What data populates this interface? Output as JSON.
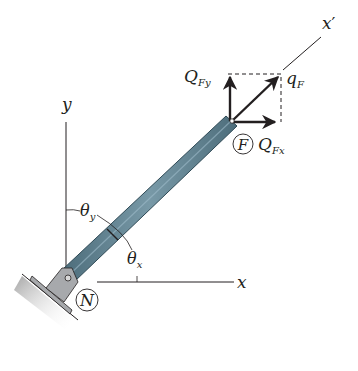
{
  "figure": {
    "axes": {
      "x_label": "x",
      "y_label": "y",
      "x_prime_label": "x",
      "x_prime_mark": "′"
    },
    "nodes": {
      "start": "N",
      "end": "F"
    },
    "angles": {
      "theta_y": {
        "symbol": "θ",
        "subscript": "y"
      },
      "theta_x": {
        "symbol": "θ",
        "subscript": "x"
      }
    },
    "forces": {
      "resultant": {
        "symbol": "q",
        "subscript": "F"
      },
      "x_component": {
        "symbol": "Q",
        "subscript": "Fx"
      },
      "y_component": {
        "symbol": "Q",
        "subscript": "Fy"
      }
    },
    "colors": {
      "bar_fill": "#5d7f8e",
      "bar_edge": "#2f4a56",
      "support_fill": "#a7a9ac",
      "ink": "#231f20"
    }
  }
}
